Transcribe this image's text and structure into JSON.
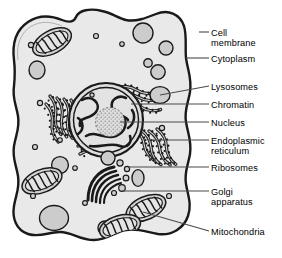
{
  "diagram": {
    "style": "grayscale line art"
  },
  "colors": {
    "background": "#ffffff",
    "cytoplasm": "#e9e9e9",
    "organelle_fill": "#c9c9c9",
    "nucleoplasm": "#dcdcdc",
    "outline": "#1a1a1a",
    "leader_line": "#555555",
    "label_text": "#000000"
  },
  "labels": [
    {
      "id": "cell-membrane",
      "text": "Cell",
      "text2": "membrane",
      "y": 28,
      "leader": {
        "x1": 199,
        "y1": 32,
        "x2": 209,
        "y2": 32
      },
      "target": {
        "x": 199,
        "y": 32
      }
    },
    {
      "id": "cytoplasm",
      "text": "Cytoplasm",
      "text2": "",
      "y": 54,
      "leader": {
        "x1": 186,
        "y1": 58,
        "x2": 209,
        "y2": 58
      },
      "target": {
        "x": 186,
        "y": 58
      }
    },
    {
      "id": "lysosomes",
      "text": "Lysosomes",
      "text2": "",
      "y": 82,
      "leader": {
        "x1": 160,
        "y1": 95,
        "x2": 209,
        "y2": 86
      },
      "target": {
        "x": 160,
        "y": 95
      }
    },
    {
      "id": "chromatin",
      "text": "Chromatin",
      "text2": "",
      "y": 100,
      "leader": {
        "x1": 131,
        "y1": 104,
        "x2": 209,
        "y2": 104
      },
      "target": {
        "x": 131,
        "y": 104
      }
    },
    {
      "id": "nucleus",
      "text": "Nucleus",
      "text2": "",
      "y": 118,
      "leader": {
        "x1": 120,
        "y1": 122,
        "x2": 209,
        "y2": 122
      },
      "target": {
        "x": 120,
        "y": 122
      }
    },
    {
      "id": "endoplasmic-reticulum",
      "text": "Endoplasmic",
      "text2": "reticulum",
      "y": 136,
      "leader": {
        "x1": 148,
        "y1": 140,
        "x2": 209,
        "y2": 140
      },
      "target": {
        "x": 148,
        "y": 140
      }
    },
    {
      "id": "ribosomes",
      "text": "Ribosomes",
      "text2": "",
      "y": 163,
      "leader": {
        "x1": 129,
        "y1": 167,
        "x2": 209,
        "y2": 167
      },
      "target": {
        "x": 129,
        "y": 167
      }
    },
    {
      "id": "golgi-apparatus",
      "text": "Golgi",
      "text2": "apparatus",
      "y": 187,
      "leader": {
        "x1": 122,
        "y1": 191,
        "x2": 209,
        "y2": 191
      },
      "target": {
        "x": 122,
        "y": 191
      }
    },
    {
      "id": "mitochondria",
      "text": "Mitochondria",
      "text2": "",
      "y": 227,
      "leader": {
        "x1": 143,
        "y1": 212,
        "x2": 209,
        "y2": 231
      },
      "target": {
        "x": 143,
        "y": 212
      }
    }
  ],
  "organelles": {
    "nucleus": {
      "cx": 106,
      "cy": 120,
      "rx": 36,
      "ry": 36,
      "nucleolus": {
        "cx": 110,
        "cy": 122,
        "r": 14
      }
    },
    "mitochondria": [
      {
        "cx": 52,
        "cy": 42,
        "angle": -28
      },
      {
        "cx": 42,
        "cy": 181,
        "angle": -22
      },
      {
        "cx": 146,
        "cy": 208,
        "angle": -24
      },
      {
        "cx": 120,
        "cy": 227,
        "angle": -16
      }
    ],
    "lysosomes": [
      {
        "cx": 160,
        "cy": 95,
        "rx": 10,
        "ry": 8
      },
      {
        "cx": 158,
        "cy": 72,
        "rx": 7,
        "ry": 7
      },
      {
        "cx": 143,
        "cy": 33,
        "r": 10
      },
      {
        "cx": 165,
        "cy": 48,
        "r": 7
      },
      {
        "cx": 37,
        "cy": 70,
        "rx": 8,
        "ry": 9
      },
      {
        "cx": 60,
        "cy": 165,
        "r": 8
      },
      {
        "cx": 108,
        "cy": 158,
        "r": 7
      },
      {
        "cx": 54,
        "cy": 218,
        "rx": 14,
        "ry": 12
      },
      {
        "cx": 105,
        "cy": 228,
        "r": 7
      },
      {
        "cx": 138,
        "cy": 178,
        "rx": 6,
        "ry": 8
      }
    ],
    "golgi": {
      "cx": 106,
      "cy": 182,
      "cisternae": 5
    },
    "er_regions": [
      {
        "cx": 62,
        "cy": 122,
        "angle": 78
      },
      {
        "cx": 139,
        "cy": 102,
        "angle": 8
      },
      {
        "cx": 150,
        "cy": 150,
        "angle": 62
      },
      {
        "cx": 100,
        "cy": 152,
        "angle": 10
      }
    ],
    "free_ribosomes": [
      {
        "cx": 31,
        "cy": 45
      },
      {
        "cx": 96,
        "cy": 36
      },
      {
        "cx": 122,
        "cy": 44
      },
      {
        "cx": 40,
        "cy": 103
      },
      {
        "cx": 35,
        "cy": 147
      },
      {
        "cx": 162,
        "cy": 128
      },
      {
        "cx": 33,
        "cy": 196
      },
      {
        "cx": 85,
        "cy": 203
      },
      {
        "cx": 60,
        "cy": 140
      },
      {
        "cx": 148,
        "cy": 240
      },
      {
        "cx": 75,
        "cy": 168
      }
    ]
  }
}
